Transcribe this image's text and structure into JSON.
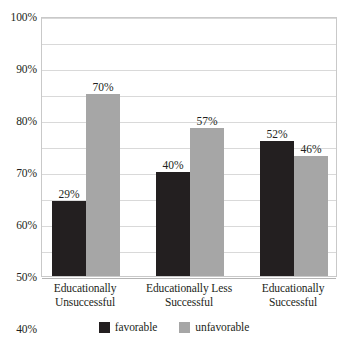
{
  "chart_data": {
    "type": "bar",
    "title": "",
    "xlabel": "",
    "ylabel": "",
    "ylim": [
      0,
      100
    ],
    "grid": true,
    "legend_position": "bottom",
    "categories": [
      "Educationally Unsuccessful",
      "Educationally Less Successful",
      "Educationally Successful"
    ],
    "category_lines": [
      [
        "Educationally",
        "Unsuccessful"
      ],
      [
        "Educationally Less",
        "Successful"
      ],
      [
        "Educationally",
        "Successful"
      ]
    ],
    "series": [
      {
        "name": "favorable",
        "color": "#231f20",
        "values": [
          29,
          40,
          52
        ],
        "labels": [
          "29%",
          "40%",
          "52%"
        ]
      },
      {
        "name": "unfavorable",
        "color": "#a6a6a6",
        "values": [
          70,
          57,
          46
        ],
        "labels": [
          "70%",
          "57%",
          "46%"
        ]
      }
    ],
    "y_ticks": [
      0,
      10,
      20,
      30,
      40,
      50,
      60,
      70,
      80,
      90,
      100
    ],
    "y_tick_labels": [
      "0%",
      "10%",
      "20%",
      "30%",
      "40%",
      "50%",
      "60%",
      "70%",
      "80%",
      "90%",
      "100%"
    ]
  },
  "legend": {
    "items": [
      {
        "label": "favorable",
        "color": "#231f20"
      },
      {
        "label": "unfavorable",
        "color": "#a6a6a6"
      }
    ]
  },
  "colors": {
    "favorable": "#231f20",
    "unfavorable": "#a6a6a6",
    "gridline": "#d9d9d9",
    "axis": "#c9c9c9",
    "text": "#231f20",
    "background": "#ffffff"
  }
}
